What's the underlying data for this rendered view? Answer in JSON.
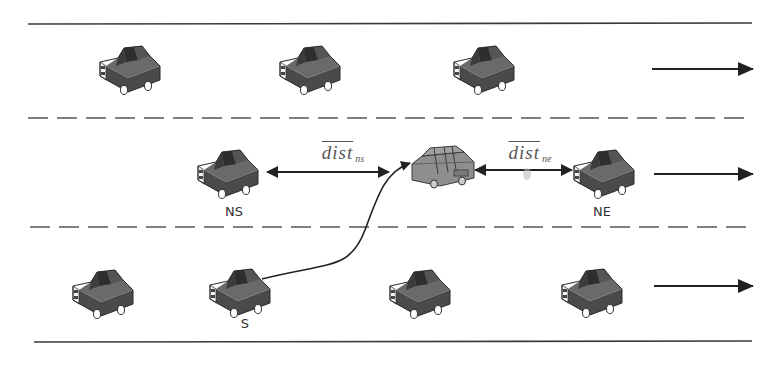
{
  "diagram": {
    "road": {
      "edge_color": "#3a3a3a",
      "top_edge_y": 24,
      "bottom_edge_y": 342,
      "lane_divider_ys": [
        118,
        227
      ]
    },
    "lanes": [
      {
        "name": "upper-lane",
        "direction": "right",
        "cars": [
          128,
          308,
          480
        ]
      },
      {
        "name": "middle-lane",
        "direction": "right",
        "cars": [
          227,
          603
        ]
      },
      {
        "name": "lower-lane",
        "direction": "right",
        "cars": [
          102,
          238,
          415,
          590
        ]
      }
    ],
    "subject_car": {
      "label": "S",
      "x": 238,
      "lane": "lower"
    },
    "target_car": {
      "x": 440,
      "lane": "middle",
      "color": "#8c8c8c"
    },
    "neighbors": [
      {
        "label": "NS",
        "x": 227,
        "lane": "middle"
      },
      {
        "label": "NE",
        "x": 603,
        "lane": "middle"
      }
    ],
    "distances": [
      {
        "main": "dist",
        "sub": "ns",
        "from": "NS",
        "to": "target"
      },
      {
        "main": "dist",
        "sub": "ne",
        "from": "target",
        "to": "NE"
      }
    ],
    "labels": {
      "ns": "NS",
      "ne": "NE",
      "s": "S"
    },
    "colors": {
      "car_body": "#5c5c5c",
      "car_dark": "#333333",
      "car_target": "#8e8e8e",
      "arrow": "#222222"
    }
  }
}
